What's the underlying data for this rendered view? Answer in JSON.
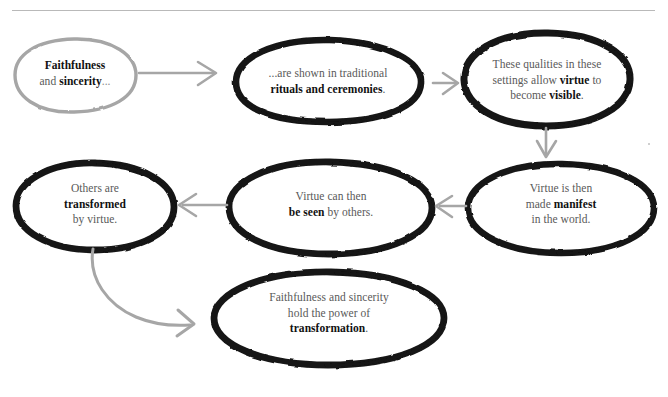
{
  "diagram": {
    "style": {
      "ink_black": "#141414",
      "ink_gray": "#a6a6a6",
      "text_gray": "#595959",
      "text_bold": "#111111",
      "rule_gray": "#b9b9b9",
      "background": "#ffffff"
    },
    "nodes": [
      {
        "id": "node-faithfulness-sincerity",
        "stroke": "gray",
        "lines": [
          {
            "parts": [
              {
                "t": "Faithfulness",
                "bold": true
              }
            ]
          },
          {
            "parts": [
              {
                "t": "and ",
                "bold": false
              },
              {
                "t": "sincerity",
                "bold": true
              },
              {
                "t": "...",
                "bold": false,
                "dim": true
              }
            ]
          }
        ]
      },
      {
        "id": "node-rituals-ceremonies",
        "stroke": "black",
        "lines": [
          {
            "parts": [
              {
                "t": "...are shown in traditional",
                "bold": false
              }
            ]
          },
          {
            "parts": [
              {
                "t": "rituals and ceremonies",
                "bold": true
              },
              {
                "t": ".",
                "bold": false
              }
            ]
          }
        ]
      },
      {
        "id": "node-virtue-visible",
        "stroke": "black",
        "lines": [
          {
            "parts": [
              {
                "t": "These qualities in these",
                "bold": false
              }
            ]
          },
          {
            "parts": [
              {
                "t": "settings allow ",
                "bold": false
              },
              {
                "t": "virtue",
                "bold": true
              },
              {
                "t": " to",
                "bold": false
              }
            ]
          },
          {
            "parts": [
              {
                "t": "become ",
                "bold": false
              },
              {
                "t": "visible",
                "bold": true
              },
              {
                "t": ".",
                "bold": false
              }
            ]
          }
        ]
      },
      {
        "id": "node-virtue-manifest",
        "stroke": "black",
        "lines": [
          {
            "parts": [
              {
                "t": "Virtue is then",
                "bold": false
              }
            ]
          },
          {
            "parts": [
              {
                "t": "made ",
                "bold": false
              },
              {
                "t": "manifest",
                "bold": true
              }
            ]
          },
          {
            "parts": [
              {
                "t": "in the world.",
                "bold": false
              }
            ]
          }
        ]
      },
      {
        "id": "node-virtue-be-seen",
        "stroke": "black",
        "lines": [
          {
            "parts": [
              {
                "t": "Virtue can then",
                "bold": false
              }
            ]
          },
          {
            "parts": [
              {
                "t": "be seen",
                "bold": true
              },
              {
                "t": " by others.",
                "bold": false
              }
            ]
          }
        ]
      },
      {
        "id": "node-others-transformed",
        "stroke": "black",
        "lines": [
          {
            "parts": [
              {
                "t": "Others are",
                "bold": false
              }
            ]
          },
          {
            "parts": [
              {
                "t": "transformed",
                "bold": true
              }
            ]
          },
          {
            "parts": [
              {
                "t": "by virtue.",
                "bold": false
              }
            ]
          }
        ]
      },
      {
        "id": "node-power-of-transformation",
        "stroke": "black",
        "lines": [
          {
            "parts": [
              {
                "t": "Faithfulness and sincerity",
                "bold": false
              }
            ]
          },
          {
            "parts": [
              {
                "t": "hold the power of",
                "bold": false
              }
            ]
          },
          {
            "parts": [
              {
                "t": "transformation",
                "bold": true
              },
              {
                "t": ".",
                "bold": false
              }
            ]
          }
        ]
      }
    ],
    "connectors": [
      {
        "id": "arrow-1-to-2",
        "from": "node-faithfulness-sincerity",
        "to": "node-rituals-ceremonies",
        "direction": "right"
      },
      {
        "id": "arrow-2-to-3",
        "from": "node-rituals-ceremonies",
        "to": "node-virtue-visible",
        "direction": "right"
      },
      {
        "id": "arrow-3-to-4",
        "from": "node-virtue-visible",
        "to": "node-virtue-manifest",
        "direction": "down"
      },
      {
        "id": "arrow-4-to-5",
        "from": "node-virtue-manifest",
        "to": "node-virtue-be-seen",
        "direction": "left"
      },
      {
        "id": "arrow-5-to-6",
        "from": "node-virtue-be-seen",
        "to": "node-others-transformed",
        "direction": "left"
      },
      {
        "id": "arrow-6-to-7",
        "from": "node-others-transformed",
        "to": "node-power-of-transformation",
        "direction": "curve-down-right"
      }
    ]
  }
}
